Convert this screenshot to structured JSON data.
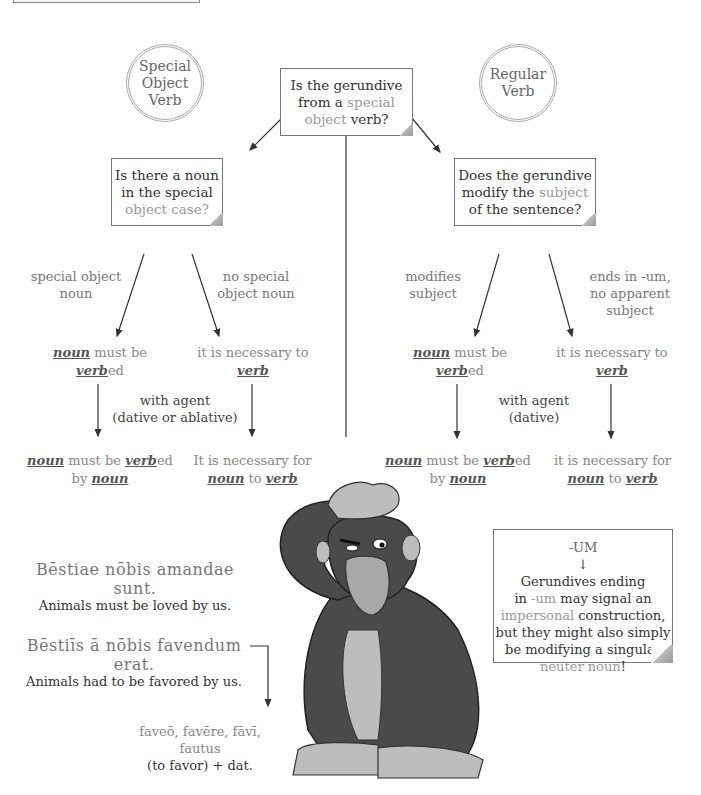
{
  "circles": {
    "left": {
      "lines": [
        "Special",
        "Object",
        "Verb"
      ]
    },
    "right": {
      "lines": [
        "Regular",
        "Verb"
      ]
    }
  },
  "top_question": {
    "l1": "Is the gerundive",
    "l2a": "from a ",
    "l2b": "special",
    "l3a": "object",
    "l3b": " verb?"
  },
  "left_question": {
    "l1": "Is there a noun",
    "l2": "in the special",
    "l3": "object case?"
  },
  "right_question": {
    "l1": "Does the gerundive",
    "l2a": "modify the ",
    "l2b": "subject",
    "l3": "of the sentence?"
  },
  "left_branch": {
    "label_a": [
      "special object",
      "noun"
    ],
    "label_b": [
      "no special",
      "object noun"
    ],
    "result_a": {
      "noun": "noun",
      "mid": " must be",
      "verb": "verb",
      "suffix": "ed"
    },
    "result_b": {
      "text": "it is necessary to",
      "verb": "verb"
    },
    "agent": [
      "with agent",
      "(dative or ablative)"
    ],
    "final_a": {
      "noun": "noun",
      "mid": " must be ",
      "verb": "verb",
      "suffix": "ed",
      "by": "by ",
      "noun2": "noun"
    },
    "final_b": {
      "text": "It is necessary for",
      "noun": "noun",
      "to": " to ",
      "verb": "verb"
    }
  },
  "right_branch": {
    "label_a": [
      "modifies",
      "subject"
    ],
    "label_b": [
      "ends in -um,",
      "no apparent",
      "subject"
    ],
    "result_a": {
      "noun": "noun",
      "mid": " must be",
      "verb": "verb",
      "suffix": "ed"
    },
    "result_b": {
      "text": "it is necessary to",
      "verb": "verb"
    },
    "agent": [
      "with agent",
      "(dative)"
    ],
    "final_a": {
      "noun": "noun",
      "mid": " must be ",
      "verb": "verb",
      "suffix": "ed",
      "by": "by ",
      "noun2": "noun"
    },
    "final_b": {
      "text": "it is necessary for",
      "noun": "noun",
      "to": " to ",
      "verb": "verb"
    }
  },
  "examples": [
    {
      "latin": "Bēstiae nōbis amandae sunt.",
      "english": "Animals must be loved by us."
    },
    {
      "latin": "Bēstiīs ā nōbis favendum erat.",
      "english": "Animals had to be favored by us."
    }
  ],
  "vocab": {
    "l1": "faveō, favēre, fāvī, fautus",
    "l2": "(to favor) + dat."
  },
  "note": {
    "title": "-UM",
    "arrow": "↓",
    "l1": "Gerundives ending",
    "l2a": "in ",
    "l2b": "-um",
    "l2c": " may signal an",
    "l3a": "impersonal",
    "l3b": " construction,",
    "l4": "but they might also simply",
    "l5": "be modifying a singular",
    "l6a": "neuter noun",
    "l6b": "!"
  },
  "illustration": {
    "subject": "gorilla-scratching-head"
  }
}
